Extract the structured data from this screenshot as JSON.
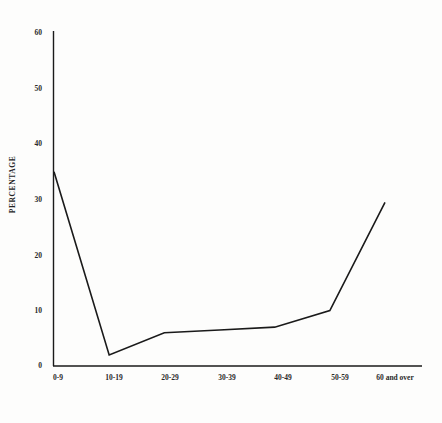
{
  "chart_data": {
    "type": "line",
    "title": "",
    "subtitle": "",
    "xlabel": "AGE IN YEARS",
    "ylabel": "PERCENTAGE",
    "categories": [
      "0-9",
      "10-19",
      "20-29",
      "30-39",
      "40-49",
      "50-59",
      "60 and over"
    ],
    "values": [
      35,
      2,
      6,
      6.5,
      7,
      10,
      29.5
    ],
    "series": [
      {
        "name": "Percentage",
        "values": [
          35,
          2,
          6,
          6.5,
          7,
          10,
          29.5
        ]
      }
    ],
    "ylim": [
      0,
      60
    ],
    "yticks": [
      0,
      10,
      20,
      30,
      40,
      50,
      60
    ],
    "ytick_labels": [
      "0",
      "10",
      "20",
      "30",
      "40",
      "50",
      "60"
    ],
    "grid": false,
    "legend": false,
    "legend_position": "none",
    "line_color": "#1a1a1a",
    "line_width": 1.6,
    "markers": false,
    "background_color": "#fdfdfc",
    "axis_color": "#1a1a1a",
    "annotations": []
  },
  "axes": {
    "y_title": "PERCENTAGE",
    "x_title": "AGE IN YEARS",
    "y_ticks": [
      {
        "label": "60",
        "value": 60
      },
      {
        "label": "50",
        "value": 50
      },
      {
        "label": "40",
        "value": 40
      },
      {
        "label": "30",
        "value": 30
      },
      {
        "label": "20",
        "value": 20
      },
      {
        "label": "10",
        "value": 10
      },
      {
        "label": "0",
        "value": 0
      }
    ],
    "x_ticks": [
      {
        "label": "0-9"
      },
      {
        "label": "10-19"
      },
      {
        "label": "20-29"
      },
      {
        "label": "30-39"
      },
      {
        "label": "40-49"
      },
      {
        "label": "50-59"
      },
      {
        "label": "60 and over"
      }
    ]
  }
}
